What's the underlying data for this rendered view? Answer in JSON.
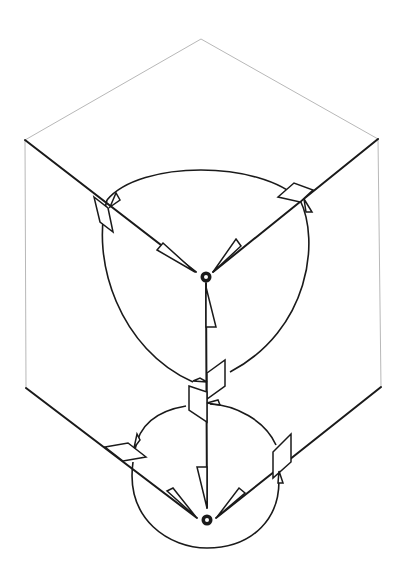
{
  "diagram": {
    "type": "isometric-cube-vector-diagram",
    "colors": {
      "background": "#ffffff",
      "edge_thin": "#b8b8b8",
      "edge_thick": "#1a1a1a"
    },
    "cube": {
      "top_vertex": [
        201,
        39
      ],
      "upper_left": [
        25,
        140
      ],
      "upper_right": [
        378,
        139
      ],
      "lower_left": [
        26,
        388
      ],
      "lower_right": [
        381,
        387
      ]
    },
    "nodes": [
      {
        "name": "upper-center-node",
        "pos": [
          206,
          277
        ]
      },
      {
        "name": "lower-center-node",
        "pos": [
          207,
          520
        ]
      }
    ]
  }
}
